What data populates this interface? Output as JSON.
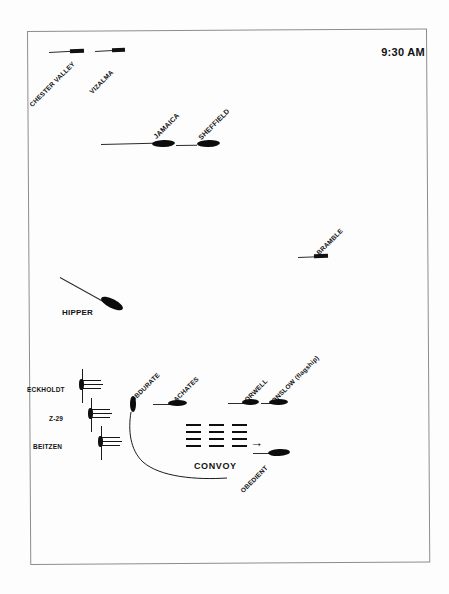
{
  "diagram": {
    "timestamp": "9:30 AM",
    "convoy_label": "CONVOY",
    "frame": {
      "border_color": "#8d8d8d",
      "background": "#fdfdfd"
    },
    "ink_color": "#111111"
  },
  "units": [
    {
      "name": "CHESTER VALLEY",
      "type": "merchant",
      "symbol": "bar",
      "rotated_label": true,
      "x": 82,
      "y": 50
    },
    {
      "name": "VIZALMA",
      "type": "trawler",
      "symbol": "bar",
      "rotated_label": true,
      "x": 122,
      "y": 50
    },
    {
      "name": "JAMAICA",
      "type": "cruiser",
      "symbol": "ellipse",
      "rotated_label": true,
      "x": 163,
      "y": 143
    },
    {
      "name": "SHEFFIELD",
      "type": "cruiser",
      "symbol": "ellipse",
      "rotated_label": true,
      "x": 208,
      "y": 144
    },
    {
      "name": "BRAMBLE",
      "type": "minesweeper",
      "symbol": "bar",
      "rotated_label": true,
      "x": 322,
      "y": 256
    },
    {
      "name": "HIPPER",
      "type": "heavy-cruiser",
      "symbol": "ellipse",
      "rotated_label": false,
      "x": 110,
      "y": 306
    },
    {
      "name": "ECKHOLDT",
      "type": "destroyer-german",
      "symbol": "destroyer",
      "rotated_label": false,
      "x": 78,
      "y": 379
    },
    {
      "name": "Z-29",
      "type": "destroyer-german",
      "symbol": "destroyer",
      "rotated_label": false,
      "x": 88,
      "y": 409
    },
    {
      "name": "BEITZEN",
      "type": "destroyer-german",
      "symbol": "destroyer",
      "rotated_label": false,
      "x": 98,
      "y": 437
    },
    {
      "name": "OBDURATE",
      "type": "destroyer-british",
      "symbol": "ellipse-vertical",
      "rotated_label": true,
      "x": 132,
      "y": 400
    },
    {
      "name": "ACHATES",
      "type": "destroyer-british",
      "symbol": "ellipse",
      "rotated_label": true,
      "x": 180,
      "y": 403
    },
    {
      "name": "ORWELL",
      "type": "destroyer-british",
      "symbol": "ellipse",
      "rotated_label": true,
      "x": 251,
      "y": 400
    },
    {
      "name": "ONSLOW (flagship)",
      "type": "destroyer-british",
      "symbol": "ellipse",
      "rotated_label": true,
      "x": 277,
      "y": 401
    },
    {
      "name": "OBEDIENT",
      "type": "destroyer-british",
      "symbol": "ellipse",
      "rotated_label": true,
      "x": 274,
      "y": 455
    }
  ],
  "convoy": {
    "label": "CONVOY",
    "columns": 3,
    "rows": 4,
    "heading_arrow": "→"
  }
}
